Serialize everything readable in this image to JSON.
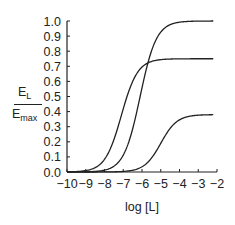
{
  "chart_data": {
    "type": "line",
    "title": "",
    "xlabel": "log [L]",
    "ylabel": "E_L / E_max",
    "ylabel_parts": {
      "numerator": "E",
      "numerator_sub": "L",
      "denominator": "E",
      "denominator_sub": "max"
    },
    "xlim": [
      -10,
      -2
    ],
    "ylim": [
      0.0,
      1.0
    ],
    "x_ticks": [
      -10,
      -9,
      -8,
      -7,
      -6,
      -5,
      -4,
      -3,
      -2
    ],
    "x_tick_labels": [
      "−10",
      "−9",
      "−8",
      "−7",
      "−6",
      "−5",
      "−4",
      "−3",
      "−2"
    ],
    "y_ticks": [
      0.0,
      0.1,
      0.2,
      0.3,
      0.4,
      0.5,
      0.6,
      0.7,
      0.8,
      0.9,
      1.0
    ],
    "y_tick_labels": [
      "0.0",
      "0.1",
      "0.2",
      "0.3",
      "0.4",
      "0.5",
      "0.6",
      "0.7",
      "0.8",
      "0.9",
      "1.0"
    ],
    "grid": false,
    "legend": null,
    "series": [
      {
        "name": "full agonist (Emax 1.0)",
        "emax": 1.0,
        "log_ec50": -6.1,
        "hill": 1.0,
        "x": [
          -10,
          -9,
          -8,
          -7,
          -6.5,
          -6.1,
          -5.5,
          -5,
          -4,
          -3,
          -2.2
        ],
        "y": [
          0.0,
          0.0,
          0.01,
          0.11,
          0.28,
          0.5,
          0.8,
          0.93,
          0.99,
          1.0,
          1.0
        ]
      },
      {
        "name": "partial agonist (Emax 0.75)",
        "emax": 0.75,
        "log_ec50": -7.1,
        "hill": 1.0,
        "x": [
          -10,
          -9,
          -8,
          -7.5,
          -7.1,
          -6.5,
          -6,
          -5,
          -4,
          -3,
          -2.2
        ],
        "y": [
          0.0,
          0.01,
          0.08,
          0.21,
          0.375,
          0.6,
          0.7,
          0.75,
          0.75,
          0.75,
          0.75
        ]
      },
      {
        "name": "partial agonist (Emax 0.38)",
        "emax": 0.38,
        "log_ec50": -5.0,
        "hill": 1.0,
        "x": [
          -10,
          -8,
          -7,
          -6,
          -5.5,
          -5,
          -4.5,
          -4,
          -3,
          -2.2
        ],
        "y": [
          0.0,
          0.0,
          0.004,
          0.035,
          0.09,
          0.19,
          0.29,
          0.34,
          0.375,
          0.38
        ]
      }
    ]
  }
}
